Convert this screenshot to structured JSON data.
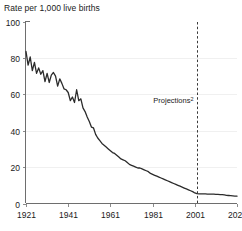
{
  "chart_data": {
    "type": "line",
    "title": "Rate per 1,000 live births",
    "xlabel": "",
    "ylabel": "",
    "xlim": [
      1921,
      2021
    ],
    "ylim": [
      0,
      100
    ],
    "xticks": [
      1921,
      1941,
      1961,
      1981,
      2001,
      2021
    ],
    "yticks": [
      0,
      20,
      40,
      60,
      80,
      100
    ],
    "grid": "horizontal-faint-at-40",
    "legend": "none",
    "annotations": [
      {
        "text": "Projections",
        "superscript": "2",
        "x": 2002,
        "y": 55,
        "marker": "vertical-dashed-line"
      }
    ],
    "projection_start_year": 2002,
    "x": [
      1921,
      1922,
      1923,
      1924,
      1925,
      1926,
      1927,
      1928,
      1929,
      1930,
      1931,
      1932,
      1933,
      1934,
      1935,
      1936,
      1937,
      1938,
      1939,
      1940,
      1941,
      1942,
      1943,
      1944,
      1945,
      1946,
      1947,
      1948,
      1949,
      1950,
      1951,
      1952,
      1953,
      1954,
      1955,
      1956,
      1957,
      1958,
      1959,
      1960,
      1961,
      1962,
      1963,
      1964,
      1965,
      1966,
      1967,
      1968,
      1969,
      1970,
      1971,
      1972,
      1973,
      1974,
      1975,
      1976,
      1977,
      1978,
      1979,
      1980,
      1981,
      1982,
      1983,
      1984,
      1985,
      1986,
      1987,
      1988,
      1989,
      1990,
      1991,
      1992,
      1993,
      1994,
      1995,
      1996,
      1997,
      1998,
      1999,
      2000,
      2001,
      2002,
      2003,
      2004,
      2005,
      2006,
      2007,
      2008,
      2009,
      2010,
      2011,
      2012,
      2013,
      2014,
      2015,
      2016,
      2017,
      2018,
      2019,
      2020,
      2021
    ],
    "values": [
      83.5,
      76.0,
      80.5,
      73.0,
      77.5,
      71.5,
      74.5,
      71.0,
      73.0,
      67.0,
      71.5,
      66.5,
      70.5,
      72.0,
      70.0,
      64.5,
      68.5,
      66.0,
      63.0,
      62.5,
      61.0,
      56.5,
      58.5,
      55.5,
      62.5,
      56.5,
      57.5,
      52.5,
      50.5,
      47.5,
      45.0,
      42.0,
      41.5,
      38.0,
      36.0,
      34.5,
      33.0,
      32.0,
      31.0,
      30.0,
      29.0,
      28.0,
      27.5,
      26.5,
      25.5,
      24.5,
      24.0,
      23.5,
      22.5,
      21.5,
      21.0,
      20.5,
      20.0,
      19.5,
      19.5,
      19.0,
      18.5,
      18.0,
      17.5,
      16.5,
      16.0,
      15.5,
      15.0,
      14.5,
      14.0,
      13.5,
      13.0,
      12.5,
      12.0,
      11.5,
      11.0,
      10.5,
      10.0,
      9.5,
      9.0,
      8.5,
      8.0,
      7.5,
      7.0,
      6.5,
      5.8,
      5.4,
      5.3,
      5.3,
      5.3,
      5.3,
      5.2,
      5.2,
      5.1,
      5.1,
      5.0,
      5.0,
      4.9,
      4.9,
      4.7,
      4.5,
      4.4,
      4.3,
      4.2,
      4.1,
      4.0
    ]
  }
}
